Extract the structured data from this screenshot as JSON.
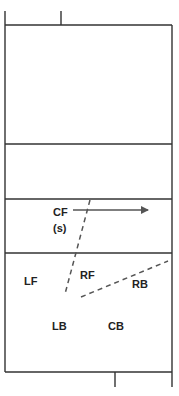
{
  "diagram": {
    "type": "volleyball-court-half-rotation",
    "line_color": "#333333",
    "dash_color": "#555555",
    "positions": [
      {
        "id": "CF",
        "label": "CF",
        "x": 53,
        "y": 216
      },
      {
        "id": "CF-sub",
        "label": "(s)",
        "x": 53,
        "y": 232
      },
      {
        "id": "LF",
        "label": "LF",
        "x": 24,
        "y": 285
      },
      {
        "id": "RF",
        "label": "RF",
        "x": 80,
        "y": 279
      },
      {
        "id": "RB",
        "label": "RB",
        "x": 132,
        "y": 288
      },
      {
        "id": "LB",
        "label": "LB",
        "x": 52,
        "y": 330
      },
      {
        "id": "CB",
        "label": "CB",
        "x": 108,
        "y": 330
      }
    ],
    "arrow": {
      "from": [
        73,
        210
      ],
      "to": [
        148,
        210
      ]
    },
    "dashed_lines": [
      {
        "from": [
          90,
          200
        ],
        "to": [
          65,
          294
        ]
      },
      {
        "from": [
          81,
          297
        ],
        "to": [
          168,
          261
        ]
      }
    ]
  }
}
